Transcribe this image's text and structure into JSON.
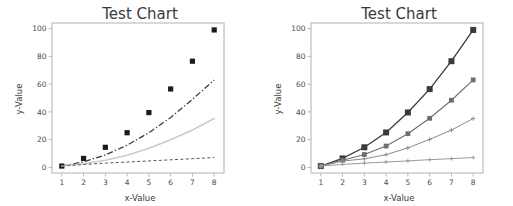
{
  "figure": {
    "background_color": "#ffffff",
    "panel_count": 2
  },
  "chart_data": [
    {
      "id": "left-panel",
      "type": "scatter",
      "title": "Test Chart",
      "xlabel": "x-Value",
      "ylabel": "y-Value",
      "xlim": [
        0.55,
        8.45
      ],
      "ylim": [
        -4,
        104
      ],
      "xticks": [
        1,
        2,
        3,
        4,
        5,
        6,
        7,
        8
      ],
      "xtick_labels": [
        "1",
        "2",
        "3",
        "4",
        "5",
        "6",
        "7",
        "8"
      ],
      "yticks": [
        0,
        20,
        40,
        60,
        80,
        100
      ],
      "ytick_labels": [
        "0",
        "20",
        "40",
        "60",
        "80",
        "100"
      ],
      "grid": false,
      "legend": "none",
      "x": [
        1,
        2,
        3,
        4,
        5,
        6,
        7,
        8
      ],
      "series": [
        {
          "name": "data-points",
          "kind": "scatter",
          "marker": "square",
          "marker_size": 2.6,
          "color": "#1b1b1b",
          "values": [
            1,
            6.5,
            14.5,
            25,
            39.5,
            56.5,
            76.5,
            99
          ]
        },
        {
          "name": "fit-quadratic",
          "kind": "line",
          "linestyle": "dashdot",
          "color": "#3c3c3c",
          "width": 1.3,
          "values": [
            1,
            4,
            9,
            16,
            25,
            36,
            49,
            63
          ]
        },
        {
          "name": "fit-linear",
          "kind": "line",
          "linestyle": "dotted-light",
          "color": "#cbcbcb",
          "width": 1.6,
          "values": [
            1,
            2.6,
            5.2,
            8.8,
            13.8,
            20,
            27,
            35.2
          ]
        },
        {
          "name": "fit-sqrt",
          "kind": "line",
          "linestyle": "dashed",
          "color": "#555555",
          "width": 1.0,
          "values": [
            1,
            2.1,
            3.1,
            3.9,
            4.7,
            5.5,
            6.3,
            7.1
          ]
        }
      ]
    },
    {
      "id": "right-panel",
      "type": "line",
      "title": "Test Chart",
      "xlabel": "x-Value",
      "ylabel": "y-Value",
      "xlim": [
        0.55,
        8.45
      ],
      "ylim": [
        -4,
        104
      ],
      "xticks": [
        1,
        2,
        3,
        4,
        5,
        6,
        7,
        8
      ],
      "xtick_labels": [
        "1",
        "2",
        "3",
        "4",
        "5",
        "6",
        "7",
        "8"
      ],
      "yticks": [
        0,
        20,
        40,
        60,
        80,
        100
      ],
      "ytick_labels": [
        "0",
        "20",
        "40",
        "60",
        "80",
        "100"
      ],
      "grid": false,
      "legend": "none",
      "x": [
        1,
        2,
        3,
        4,
        5,
        6,
        7,
        8
      ],
      "series": [
        {
          "name": "series-1",
          "kind": "line-marker",
          "marker": "square",
          "marker_size": 3.0,
          "color": "#3a3a3a",
          "width": 1.3,
          "values": [
            1,
            6.5,
            14.5,
            25.2,
            39.6,
            56.4,
            76.5,
            99
          ]
        },
        {
          "name": "series-2",
          "kind": "line-marker",
          "marker": "square",
          "marker_size": 2.4,
          "color": "#6e6e6e",
          "width": 1.1,
          "values": [
            1,
            5.2,
            9.3,
            15.4,
            24.3,
            35.4,
            48.4,
            63
          ]
        },
        {
          "name": "series-3",
          "kind": "line-marker",
          "marker": "plus",
          "marker_size": 2.2,
          "color": "#8a8a8a",
          "width": 1.0,
          "values": [
            1,
            4.6,
            6.2,
            9.2,
            14.1,
            20.2,
            26.9,
            35.2
          ]
        },
        {
          "name": "series-4",
          "kind": "line-marker",
          "marker": "plus",
          "marker_size": 2.0,
          "color": "#9a9a9a",
          "width": 1.0,
          "values": [
            1,
            2.2,
            3.1,
            3.9,
            4.7,
            5.6,
            6.3,
            7.1
          ]
        }
      ]
    }
  ]
}
